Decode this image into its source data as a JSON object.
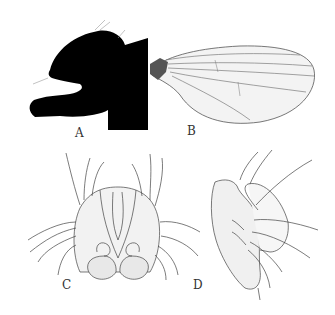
{
  "figure": {
    "panels": [
      {
        "id": "A",
        "label": "A",
        "content": "head-thorax-silhouette"
      },
      {
        "id": "B",
        "label": "B",
        "content": "wing"
      },
      {
        "id": "C",
        "label": "C",
        "content": "genitalia-posterior-view"
      },
      {
        "id": "D",
        "label": "D",
        "content": "genitalia-lateral-view"
      }
    ],
    "colors": {
      "background": "#ffffff",
      "silhouette": "#000000",
      "line": "#444444",
      "fill": "#efefef",
      "label": "#333333"
    }
  }
}
